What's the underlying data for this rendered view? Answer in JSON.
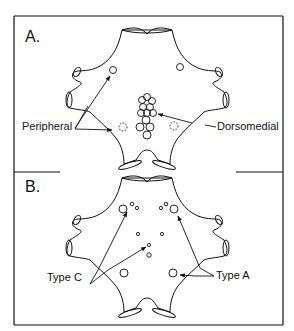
{
  "figure": {
    "panels": [
      {
        "id": "A",
        "label": "A.",
        "annotations": [
          {
            "text": "Peripheral",
            "target": "peripheral-cells"
          },
          {
            "text": "Dorsomedial",
            "target": "dorsomedial-cluster"
          }
        ]
      },
      {
        "id": "B",
        "label": "B.",
        "annotations": [
          {
            "text": "Type C",
            "target": "small-cells"
          },
          {
            "text": "Type A",
            "target": "large-cells"
          }
        ]
      }
    ],
    "colors": {
      "line": "#111111",
      "background": "#ffffff"
    }
  }
}
